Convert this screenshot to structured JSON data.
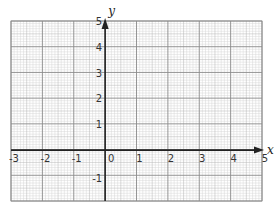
{
  "figure": {
    "type": "coordinate-grid",
    "x_axis": {
      "name": "x",
      "min": -3,
      "max": 5,
      "tick_labels": [
        "-3",
        "-2",
        "-1",
        "0",
        "1",
        "2",
        "3",
        "4",
        "5"
      ]
    },
    "y_axis": {
      "name": "y",
      "min": -1,
      "max": 5,
      "tick_labels": [
        "-1",
        "1",
        "2",
        "3",
        "4",
        "5"
      ]
    },
    "grid": {
      "major_step": 1,
      "minor_subdivisions": 10,
      "colors": {
        "major": "#8a8a8a",
        "mid": "#b5b5b5",
        "minor": "#d6d6d6",
        "axis": "#222222"
      }
    }
  }
}
